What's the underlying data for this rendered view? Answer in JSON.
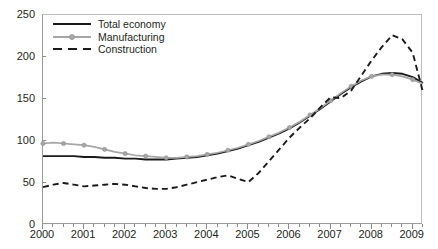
{
  "title": "",
  "legend": {
    "position": "top-left",
    "items": [
      {
        "label": "Total economy",
        "key": "total_economy",
        "style": "solid",
        "color": "#1a1a1a"
      },
      {
        "label": "Manufacturing",
        "key": "manufacturing",
        "style": "solid-markers",
        "color": "#a6a6a6"
      },
      {
        "label": "Construction",
        "key": "construction",
        "style": "dashed",
        "color": "#1a1a1a"
      }
    ]
  },
  "axes": {
    "y": {
      "min": 0,
      "max": 250,
      "step": 50,
      "ticks": [
        "0",
        "50",
        "100",
        "150",
        "200",
        "250"
      ],
      "label": ""
    },
    "x": {
      "min": 2000,
      "max": 2009.25,
      "ticks": [
        "2000",
        "2001",
        "2002",
        "2003",
        "2004",
        "2005",
        "2006",
        "2007",
        "2008",
        "2009"
      ],
      "label": "",
      "minor_per_major": 4
    }
  },
  "chart_data": {
    "type": "line",
    "title": "",
    "xlabel": "",
    "ylabel": "",
    "ylim": [
      0,
      250
    ],
    "xlim": [
      2000,
      2009.25
    ],
    "grid": false,
    "legend_position": "top-left",
    "x": [
      2000,
      2000.25,
      2000.5,
      2000.75,
      2001,
      2001.25,
      2001.5,
      2001.75,
      2002,
      2002.25,
      2002.5,
      2002.75,
      2003,
      2003.25,
      2003.5,
      2003.75,
      2004,
      2004.25,
      2004.5,
      2004.75,
      2005,
      2005.25,
      2005.5,
      2005.75,
      2006,
      2006.25,
      2006.5,
      2006.75,
      2007,
      2007.25,
      2007.5,
      2007.75,
      2008,
      2008.25,
      2008.5,
      2008.75,
      2009,
      2009.25
    ],
    "series": [
      {
        "name": "Total economy",
        "style": "solid",
        "color": "#1a1a1a",
        "markers": false,
        "values": [
          82,
          82,
          82,
          82,
          81,
          81,
          80,
          80,
          79,
          79,
          78,
          78,
          78,
          79,
          80,
          81,
          83,
          85,
          88,
          91,
          95,
          99,
          104,
          109,
          115,
          122,
          130,
          138,
          147,
          156,
          164,
          171,
          177,
          180,
          181,
          180,
          176,
          169
        ]
      },
      {
        "name": "Manufacturing",
        "style": "solid",
        "color": "#a6a6a6",
        "markers": true,
        "values": [
          97,
          98,
          97,
          96,
          95,
          93,
          90,
          87,
          85,
          83,
          82,
          81,
          80,
          80,
          81,
          82,
          84,
          86,
          89,
          92,
          96,
          100,
          105,
          110,
          116,
          123,
          131,
          139,
          148,
          157,
          165,
          172,
          177,
          179,
          179,
          177,
          173,
          168
        ]
      },
      {
        "name": "Construction",
        "style": "dashed",
        "color": "#1a1a1a",
        "markers": false,
        "values": [
          45,
          48,
          50,
          48,
          46,
          47,
          48,
          49,
          48,
          46,
          44,
          43,
          43,
          45,
          48,
          51,
          54,
          57,
          59,
          55,
          51,
          62,
          76,
          90,
          104,
          116,
          127,
          140,
          152,
          151,
          160,
          178,
          196,
          212,
          226,
          221,
          205,
          158
        ]
      }
    ]
  }
}
